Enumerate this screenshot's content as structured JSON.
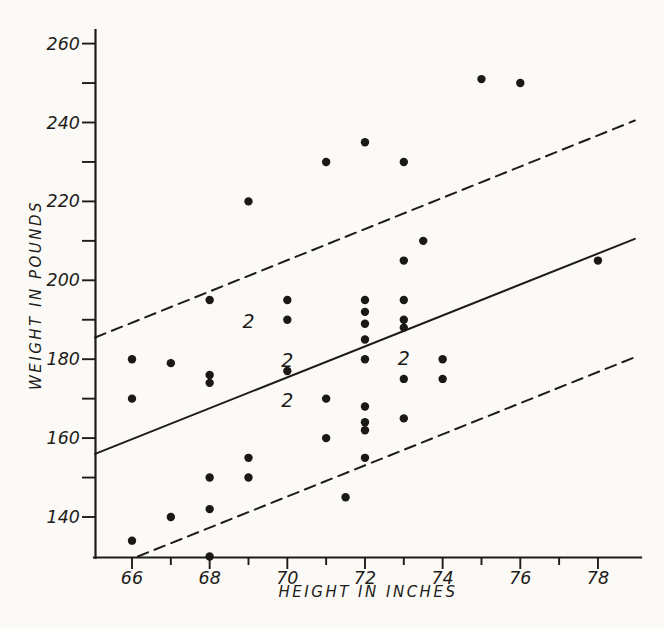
{
  "figure": {
    "background_color": "#fbfaf6",
    "ink_color": "#1e1c1a"
  },
  "chart_data": {
    "type": "scatter",
    "title": "",
    "xlabel": "HEIGHT IN INCHES",
    "ylabel": "WEIGHT IN POUNDS",
    "axes": {
      "xlim": [
        65,
        79.1
      ],
      "ylim": [
        129.5,
        263.5
      ],
      "x_ticks_major": [
        66,
        68,
        70,
        72,
        74,
        76,
        78
      ],
      "x_ticks_minor": [
        67,
        69,
        71,
        73,
        75,
        77
      ],
      "y_ticks_major": [
        140,
        160,
        180,
        200,
        220,
        240,
        260
      ],
      "y_ticks_minor": [
        150,
        170,
        190,
        210,
        230,
        250
      ],
      "grid": false,
      "legend": "none"
    },
    "points": [
      [
        66,
        180
      ],
      [
        66,
        170
      ],
      [
        66,
        134
      ],
      [
        67,
        179
      ],
      [
        67,
        140
      ],
      [
        68,
        195
      ],
      [
        68,
        176
      ],
      [
        68,
        174
      ],
      [
        68,
        150
      ],
      [
        68,
        142
      ],
      [
        68,
        130
      ],
      [
        69,
        220
      ],
      [
        69,
        155
      ],
      [
        69,
        150
      ],
      [
        70,
        195
      ],
      [
        70,
        190
      ],
      [
        70,
        177
      ],
      [
        71,
        230
      ],
      [
        71,
        170
      ],
      [
        71,
        160
      ],
      [
        71.5,
        145
      ],
      [
        72,
        235
      ],
      [
        72,
        195
      ],
      [
        72,
        192
      ],
      [
        72,
        189
      ],
      [
        72,
        185
      ],
      [
        72,
        180
      ],
      [
        72,
        168
      ],
      [
        72,
        164
      ],
      [
        72,
        162
      ],
      [
        72,
        155
      ],
      [
        73,
        230
      ],
      [
        73,
        205
      ],
      [
        73,
        195
      ],
      [
        73,
        190
      ],
      [
        73,
        188
      ],
      [
        73,
        175
      ],
      [
        73,
        165
      ],
      [
        73.5,
        210
      ],
      [
        74,
        180
      ],
      [
        74,
        175
      ],
      [
        75,
        251
      ],
      [
        76,
        250
      ],
      [
        78,
        205
      ]
    ],
    "frequency_labels": [
      {
        "text": "2",
        "x": 69.0,
        "y": 189.5
      },
      {
        "text": "2",
        "x": 70.0,
        "y": 179.6
      },
      {
        "text": "2",
        "x": 70.0,
        "y": 169.6
      },
      {
        "text": "2",
        "x": 73.0,
        "y": 180.1
      }
    ],
    "lines": [
      {
        "name": "regression",
        "style": "solid",
        "x1": 65.05,
        "y1": 156.0,
        "x2": 78.95,
        "y2": 210.5
      },
      {
        "name": "upper-band",
        "style": "dashed",
        "x1": 65.05,
        "y1": 185.5,
        "x2": 78.95,
        "y2": 240.5
      },
      {
        "name": "lower-band",
        "style": "dashed",
        "x1": 66.15,
        "y1": 130.0,
        "x2": 78.95,
        "y2": 180.5
      }
    ]
  }
}
